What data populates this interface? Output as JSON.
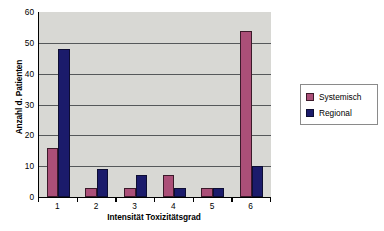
{
  "chart_data": {
    "type": "bar",
    "title": "",
    "subtitle": "",
    "xlabel": "Intensität Toxizitätsgrad",
    "ylabel": "Anzahl d. Patienten",
    "categories": [
      "1",
      "2",
      "3",
      "4",
      "5",
      "6"
    ],
    "series": [
      {
        "name": "Systemisch",
        "color": "#ab4f78",
        "values": [
          16,
          3,
          3,
          7,
          3,
          54
        ]
      },
      {
        "name": "Regional",
        "color": "#1b1b6b",
        "values": [
          48,
          9,
          7,
          3,
          3,
          10
        ]
      }
    ],
    "ylim": [
      0,
      60
    ],
    "ytick_values": [
      0,
      10,
      20,
      30,
      40,
      50,
      60
    ],
    "ytick_labels": [
      "0",
      "10",
      "20",
      "30",
      "40",
      "50",
      "60"
    ],
    "xtick_labels": [
      "1",
      "2",
      "3",
      "4",
      "5",
      "6"
    ],
    "grid": "horizontal",
    "legend_position": "right",
    "legend_entries": [
      "Systemisch",
      "Regional"
    ],
    "plot_background": "#d8d8d4",
    "gridline_color": "#55585a",
    "axis_color": "#000000",
    "annotations": []
  }
}
